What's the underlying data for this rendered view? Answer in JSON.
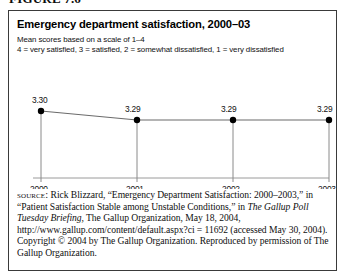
{
  "figure_caption": "FIGURE 7.6",
  "figure": {
    "title": "Emergency department satisfaction, 2000–03",
    "subtitle_line1": "Mean scores based on a scale of 1–4",
    "subtitle_line2": "4 = very satisfied, 3 = satisfied, 2 = somewhat dissatisfied, 1 = very dissatisfied"
  },
  "chart_data": {
    "type": "line",
    "title": "Emergency department satisfaction, 2000–03",
    "subtitle": "Mean scores based on a scale of 1–4; 4 = very satisfied, 3 = satisfied, 2 = somewhat dissatisfied, 1 = very dissatisfied",
    "categories": [
      "2000",
      "2001",
      "2002",
      "2003"
    ],
    "values": [
      3.3,
      3.29,
      3.29,
      3.29
    ],
    "point_labels": [
      "3.30",
      "3.29",
      "3.29",
      "3.29"
    ],
    "xlabel": "",
    "ylabel": "",
    "xlim": [
      "2000",
      "2003"
    ],
    "ylim": [
      0,
      4
    ],
    "grid": false,
    "legend": false,
    "series_color": "#6b6b6b",
    "marker_color": "#000000",
    "axis_color": "#8a8a8a"
  },
  "source": {
    "label": "source:",
    "text_part1": " Rick Blizzard, “Emergency Department Satisfaction: 2000–2003,” in “Patient Satisfaction Stable among Unstable Conditions,” in ",
    "italic_title": "The Gallup Poll Tuesday Briefing,",
    "text_part2": " The Gallup Organization, May 18, 2004, http://www.gallup.com/content/default.aspx?ci = 11692 (accessed May 30, 2004). Copyright © 2004 by The Gallup Organization. Reproduced by permission of The Gallup Organization."
  }
}
